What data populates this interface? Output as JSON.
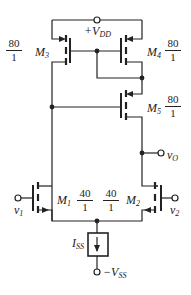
{
  "diagram": {
    "type": "circuit-schematic",
    "supply": {
      "positive": "+V",
      "positive_sub": "DD",
      "negative": "−V",
      "negative_sub": "SS"
    },
    "current_source": {
      "label": "I",
      "label_sub": "SS"
    },
    "output": {
      "label": "v",
      "label_sub": "O"
    },
    "inputs": [
      {
        "label": "v",
        "label_sub": "1"
      },
      {
        "label": "v",
        "label_sub": "2"
      }
    ],
    "transistors": [
      {
        "name": "M",
        "sub": "3",
        "ratio_num": "80",
        "ratio_den": "1",
        "type": "pmos"
      },
      {
        "name": "M",
        "sub": "4",
        "ratio_num": "80",
        "ratio_den": "1",
        "type": "pmos"
      },
      {
        "name": "M",
        "sub": "5",
        "ratio_num": "80",
        "ratio_den": "1",
        "type": "pmos"
      },
      {
        "name": "M",
        "sub": "1",
        "ratio_num": "40",
        "ratio_den": "1",
        "type": "nmos"
      },
      {
        "name": "M",
        "sub": "2",
        "ratio_num": "40",
        "ratio_den": "1",
        "type": "nmos"
      }
    ],
    "colors": {
      "line": "#222222",
      "background": "#ffffff"
    }
  }
}
